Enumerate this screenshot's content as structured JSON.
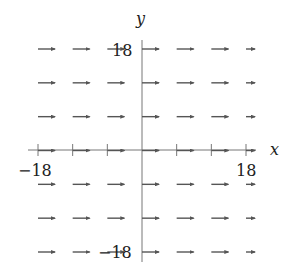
{
  "chart_data": {
    "type": "quiver",
    "title": "",
    "xlabel": "x",
    "ylabel": "y",
    "xlim": [
      -18,
      18
    ],
    "ylim": [
      -18,
      18
    ],
    "x_tick_labels": [
      "-18",
      "18"
    ],
    "y_tick_labels": [
      "18",
      "-18"
    ],
    "x_ticks": [
      -18,
      -12,
      -6,
      0,
      6,
      12,
      18
    ],
    "grid": false,
    "field_description": "Uniform horizontal vector field pointing in +x direction",
    "grid_points_x": [
      -18,
      -12,
      -6,
      0,
      6,
      12,
      18
    ],
    "grid_points_y": [
      18,
      12,
      6,
      0,
      -6,
      -12,
      -18
    ],
    "vector": {
      "u": 1,
      "v": 0
    },
    "arrow_color": "#555555",
    "axis_color": "#777777"
  },
  "labels": {
    "x_axis": "x",
    "y_axis": "y",
    "x_min": "−18",
    "x_max": "18",
    "y_max": "18",
    "y_min": "−18"
  }
}
